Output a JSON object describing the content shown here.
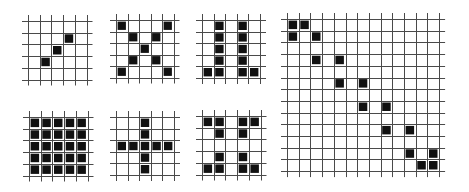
{
  "figure": {
    "background": "#ffffff",
    "line_color": "#4a4a4a",
    "fill_color": "#111111",
    "overshoot_px": 6,
    "panels": [
      {
        "id": "small-diagonal",
        "rows": 5,
        "cols": 5,
        "origin": [
          28,
          21
        ],
        "cell": 11.7,
        "filled": [
          [
            1,
            3
          ],
          [
            2,
            2
          ],
          [
            3,
            1
          ]
        ]
      },
      {
        "id": "small-x",
        "rows": 5,
        "cols": 5,
        "origin": [
          116,
          20
        ],
        "cell": 11.5,
        "filled": [
          [
            0,
            0
          ],
          [
            0,
            4
          ],
          [
            1,
            1
          ],
          [
            1,
            3
          ],
          [
            2,
            2
          ],
          [
            3,
            1
          ],
          [
            3,
            3
          ],
          [
            4,
            0
          ],
          [
            4,
            4
          ]
        ]
      },
      {
        "id": "small-two-columns",
        "rows": 5,
        "cols": 5,
        "origin": [
          202,
          20
        ],
        "cell": 11.6,
        "filled": [
          [
            0,
            1
          ],
          [
            0,
            3
          ],
          [
            1,
            1
          ],
          [
            1,
            3
          ],
          [
            2,
            1
          ],
          [
            2,
            3
          ],
          [
            3,
            1
          ],
          [
            3,
            3
          ],
          [
            4,
            0
          ],
          [
            4,
            1
          ],
          [
            4,
            3
          ],
          [
            4,
            4
          ]
        ]
      },
      {
        "id": "small-full",
        "rows": 5,
        "cols": 5,
        "origin": [
          29,
          117
        ],
        "cell": 11.7,
        "filled": [
          [
            0,
            0
          ],
          [
            0,
            1
          ],
          [
            0,
            2
          ],
          [
            0,
            3
          ],
          [
            0,
            4
          ],
          [
            1,
            0
          ],
          [
            1,
            1
          ],
          [
            1,
            2
          ],
          [
            1,
            3
          ],
          [
            1,
            4
          ],
          [
            2,
            0
          ],
          [
            2,
            1
          ],
          [
            2,
            2
          ],
          [
            2,
            3
          ],
          [
            2,
            4
          ],
          [
            3,
            0
          ],
          [
            3,
            1
          ],
          [
            3,
            2
          ],
          [
            3,
            3
          ],
          [
            3,
            4
          ],
          [
            4,
            0
          ],
          [
            4,
            1
          ],
          [
            4,
            2
          ],
          [
            4,
            3
          ],
          [
            4,
            4
          ]
        ]
      },
      {
        "id": "small-plus",
        "rows": 5,
        "cols": 5,
        "origin": [
          116,
          117
        ],
        "cell": 11.6,
        "filled": [
          [
            0,
            2
          ],
          [
            1,
            2
          ],
          [
            2,
            0
          ],
          [
            2,
            1
          ],
          [
            2,
            2
          ],
          [
            2,
            3
          ],
          [
            2,
            4
          ],
          [
            3,
            2
          ],
          [
            4,
            2
          ]
        ]
      },
      {
        "id": "small-corners",
        "rows": 5,
        "cols": 5,
        "origin": [
          202,
          116
        ],
        "cell": 11.7,
        "filled": [
          [
            0,
            0
          ],
          [
            0,
            1
          ],
          [
            0,
            3
          ],
          [
            0,
            4
          ],
          [
            1,
            1
          ],
          [
            1,
            3
          ],
          [
            3,
            1
          ],
          [
            3,
            3
          ],
          [
            4,
            0
          ],
          [
            4,
            1
          ],
          [
            4,
            3
          ],
          [
            4,
            4
          ]
        ]
      },
      {
        "id": "large-staircase",
        "rows": 13,
        "cols": 13,
        "origin": [
          287,
          19
        ],
        "cell": 11.7,
        "filled": [
          [
            0,
            0
          ],
          [
            0,
            1
          ],
          [
            1,
            0
          ],
          [
            1,
            2
          ],
          [
            3,
            2
          ],
          [
            3,
            4
          ],
          [
            5,
            4
          ],
          [
            5,
            6
          ],
          [
            7,
            6
          ],
          [
            7,
            8
          ],
          [
            9,
            8
          ],
          [
            9,
            10
          ],
          [
            11,
            10
          ],
          [
            11,
            12
          ],
          [
            12,
            11
          ],
          [
            12,
            12
          ]
        ]
      }
    ]
  }
}
